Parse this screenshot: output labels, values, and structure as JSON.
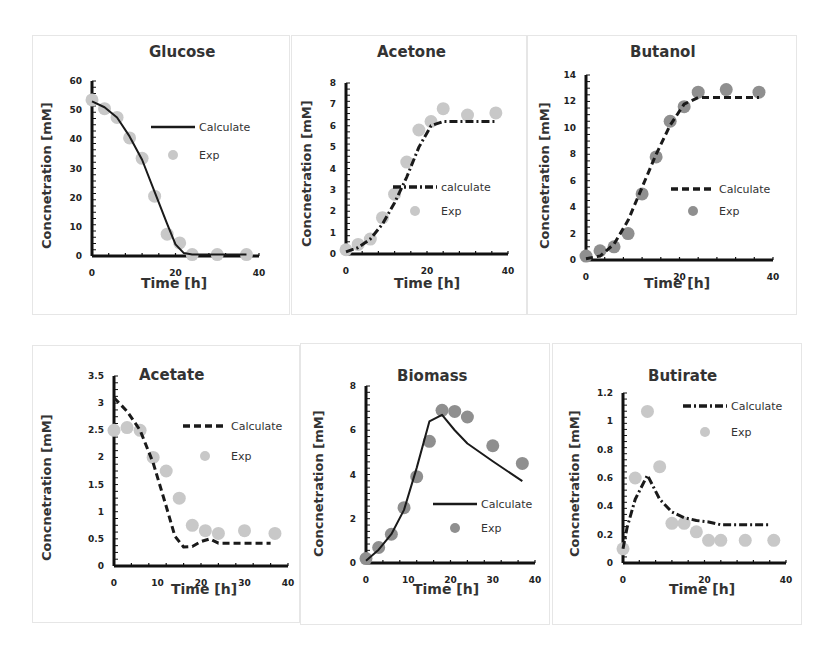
{
  "figure": {
    "xlabel": "Time [h]",
    "ylabel": "Concnetration [mM]",
    "colors": {
      "line": "#1a1a1a",
      "exp_light": "#c8c8c8",
      "exp_dark": "#8f8f8f",
      "axis": "#111111",
      "border": "#e6e6e6"
    }
  },
  "chart_data": [
    {
      "id": "glucose",
      "type": "line",
      "title": "Glucose",
      "xlabel": "Time [h]",
      "ylabel": "Concnetration [mM]",
      "xlim": [
        0,
        40
      ],
      "ylim": [
        0,
        60
      ],
      "xticks": [
        "0",
        "20",
        "40"
      ],
      "yticks": [
        "0",
        "10",
        "20",
        "30",
        "40",
        "50",
        "60"
      ],
      "series": [
        {
          "name": "Calculate",
          "style": "solid",
          "x": [
            0,
            3,
            6,
            9,
            12,
            15,
            18,
            20,
            22,
            24,
            30,
            37
          ],
          "y": [
            53,
            51,
            47.5,
            41,
            33,
            22,
            11,
            4,
            1,
            0.5,
            0.5,
            0.5
          ]
        },
        {
          "name": "Exp",
          "style": "marker",
          "marker_color": "light",
          "x": [
            0,
            3,
            6,
            9,
            12,
            15,
            18,
            21,
            24,
            30,
            37
          ],
          "y": [
            53.5,
            50.5,
            47.5,
            40.5,
            33.5,
            20.5,
            7.5,
            4.5,
            0.5,
            0.5,
            0.5
          ]
        }
      ],
      "legend": {
        "position": "upper right"
      }
    },
    {
      "id": "acetone",
      "type": "line",
      "title": "Acetone",
      "xlabel": "Time [h]",
      "ylabel": "Concnetration [mM]",
      "xlim": [
        0,
        40
      ],
      "ylim": [
        0,
        8
      ],
      "xticks": [
        "0",
        "20",
        "40"
      ],
      "yticks": [
        "0",
        "1",
        "2",
        "3",
        "4",
        "5",
        "6",
        "7",
        "8"
      ],
      "series": [
        {
          "name": "calculate",
          "style": "dashdot",
          "x": [
            0,
            3,
            6,
            9,
            12,
            15,
            18,
            21,
            24,
            30,
            37
          ],
          "y": [
            0.1,
            0.3,
            0.7,
            1.4,
            2.4,
            3.6,
            5.0,
            6.0,
            6.2,
            6.2,
            6.2
          ]
        },
        {
          "name": "Exp",
          "style": "marker",
          "marker_color": "light",
          "x": [
            0,
            3,
            6,
            9,
            12,
            15,
            18,
            21,
            24,
            30,
            37
          ],
          "y": [
            0.2,
            0.45,
            0.7,
            1.7,
            2.8,
            4.3,
            5.8,
            6.2,
            6.8,
            6.5,
            6.6
          ]
        }
      ],
      "legend": {
        "position": "center right"
      }
    },
    {
      "id": "butanol",
      "type": "line",
      "title": "Butanol",
      "xlabel": "Time [h]",
      "ylabel": "Concnetration [mM]",
      "xlim": [
        0,
        40
      ],
      "ylim": [
        0,
        14
      ],
      "xticks": [
        "0",
        "20",
        "40"
      ],
      "yticks": [
        "0",
        "2",
        "4",
        "6",
        "8",
        "10",
        "12",
        "14"
      ],
      "series": [
        {
          "name": "Calculate",
          "style": "dashed",
          "x": [
            0,
            3,
            6,
            9,
            12,
            15,
            18,
            21,
            24,
            30,
            37
          ],
          "y": [
            0.1,
            0.3,
            1.2,
            3.0,
            5.5,
            8.0,
            10.2,
            11.8,
            12.3,
            12.3,
            12.3
          ]
        },
        {
          "name": "Exp",
          "style": "marker",
          "marker_color": "dark",
          "x": [
            0,
            3,
            6,
            9,
            12,
            15,
            18,
            21,
            24,
            30,
            37
          ],
          "y": [
            0.3,
            0.7,
            1.0,
            2.0,
            5.0,
            7.8,
            10.5,
            11.6,
            12.7,
            12.9,
            12.7
          ]
        }
      ],
      "legend": {
        "position": "center right"
      }
    },
    {
      "id": "acetate",
      "type": "line",
      "title": "Acetate",
      "xlabel": "Time [h]",
      "ylabel": "Concnetration [mM]",
      "xlim": [
        0,
        40
      ],
      "ylim": [
        0,
        3.5
      ],
      "xticks": [
        "0",
        "10",
        "20",
        "30",
        "40"
      ],
      "yticks": [
        "0",
        "0.5",
        "1",
        "1.5",
        "2",
        "2.5",
        "3",
        "3.5"
      ],
      "series": [
        {
          "name": "Calculate",
          "style": "dashed",
          "x": [
            0,
            3,
            6,
            9,
            12,
            14,
            16,
            18,
            20,
            22,
            24,
            30,
            36
          ],
          "y": [
            3.1,
            2.85,
            2.5,
            1.9,
            1.1,
            0.55,
            0.35,
            0.36,
            0.45,
            0.5,
            0.42,
            0.42,
            0.42
          ]
        },
        {
          "name": "Exp",
          "style": "marker",
          "marker_color": "light",
          "x": [
            0,
            3,
            6,
            9,
            12,
            15,
            18,
            21,
            24,
            30,
            37
          ],
          "y": [
            2.5,
            2.55,
            2.5,
            2.0,
            1.75,
            1.25,
            0.75,
            0.65,
            0.6,
            0.65,
            0.6
          ]
        }
      ],
      "legend": {
        "position": "upper right"
      }
    },
    {
      "id": "biomass",
      "type": "line",
      "title": "Biomass",
      "xlabel": "Time [h]",
      "ylabel": "Concnetration [mM]",
      "xlim": [
        0,
        40
      ],
      "ylim": [
        0,
        8
      ],
      "xticks": [
        "0",
        "10",
        "20",
        "30",
        "40"
      ],
      "yticks": [
        "0",
        "2",
        "4",
        "6",
        "8"
      ],
      "series": [
        {
          "name": "Calculate",
          "style": "solid",
          "x": [
            0,
            3,
            6,
            9,
            12,
            15,
            18,
            21,
            24,
            30,
            37
          ],
          "y": [
            0.1,
            0.6,
            1.3,
            2.4,
            4.3,
            6.4,
            6.7,
            6.0,
            5.4,
            4.6,
            3.7
          ]
        },
        {
          "name": "Exp",
          "style": "marker",
          "marker_color": "dark",
          "x": [
            0,
            3,
            6,
            9,
            12,
            15,
            18,
            21,
            24,
            30,
            37
          ],
          "y": [
            0.2,
            0.7,
            1.3,
            2.5,
            3.9,
            5.5,
            6.9,
            6.85,
            6.6,
            5.3,
            4.5
          ]
        }
      ],
      "legend": {
        "position": "lower right"
      }
    },
    {
      "id": "butirate",
      "type": "line",
      "title": "Butirate",
      "xlabel": "Time [h]",
      "ylabel": "Concnetration [mM]",
      "xlim": [
        0,
        40
      ],
      "ylim": [
        0,
        1.2
      ],
      "xticks": [
        "0",
        "20",
        "40"
      ],
      "yticks": [
        "0",
        "0.2",
        "0.4",
        "0.6",
        "0.8",
        "1",
        "1.2"
      ],
      "series": [
        {
          "name": "Calculate",
          "style": "dashdot",
          "x": [
            0,
            1,
            3,
            6,
            9,
            12,
            15,
            18,
            21,
            24,
            30,
            36
          ],
          "y": [
            0.1,
            0.25,
            0.45,
            0.62,
            0.45,
            0.36,
            0.32,
            0.3,
            0.29,
            0.27,
            0.27,
            0.27
          ]
        },
        {
          "name": "Exp",
          "style": "marker",
          "marker_color": "light",
          "x": [
            0,
            3,
            6,
            9,
            12,
            15,
            18,
            21,
            24,
            30,
            37
          ],
          "y": [
            0.1,
            0.6,
            1.07,
            0.68,
            0.28,
            0.28,
            0.22,
            0.16,
            0.16,
            0.16,
            0.16
          ]
        }
      ],
      "legend": {
        "position": "upper right"
      }
    }
  ]
}
